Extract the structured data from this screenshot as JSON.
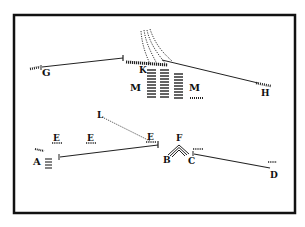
{
  "diagram": {
    "type": "battle-formation-sketch",
    "frame": {
      "x": 13,
      "y": 14,
      "width": 283,
      "height": 200,
      "stroke": "#111111",
      "fill": "#ffffff"
    },
    "ink_color": "#1a1a1a",
    "labels": {
      "G": "G",
      "K": "K",
      "M_left": "M",
      "M_right": "M",
      "H": "H",
      "L": "L",
      "E_1": "E",
      "E_2": "E",
      "E_3": "E",
      "A": "A",
      "B": "B",
      "F": "F",
      "C": "C",
      "D": "D"
    },
    "lines": [
      {
        "id": "G-K",
        "from": [
          42,
          67
        ],
        "to": [
          123,
          58
        ],
        "style": "solid"
      },
      {
        "id": "K-H",
        "from": [
          162,
          60
        ],
        "to": [
          258,
          83
        ],
        "style": "solid"
      },
      {
        "id": "A-E",
        "from": [
          60,
          157
        ],
        "to": [
          157,
          144
        ],
        "style": "solid"
      },
      {
        "id": "C-D",
        "from": [
          194,
          152
        ],
        "to": [
          270,
          168
        ],
        "style": "solid"
      },
      {
        "id": "L-E",
        "from": [
          100,
          116
        ],
        "to": [
          150,
          141
        ],
        "style": "dotted"
      }
    ]
  }
}
